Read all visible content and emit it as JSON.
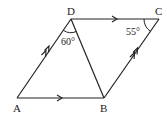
{
  "figure": {
    "type": "parallelogram",
    "vertices": {
      "A": {
        "label": "A",
        "x": 17,
        "y": 98
      },
      "B": {
        "label": "B",
        "x": 104,
        "y": 98
      },
      "C": {
        "label": "C",
        "x": 159,
        "y": 19
      },
      "D": {
        "label": "D",
        "x": 71,
        "y": 19
      }
    },
    "segments": [
      "AB",
      "BC",
      "CD",
      "DA",
      "DB"
    ],
    "parallel_marks": {
      "AB": "single arrow",
      "DC": "single arrow",
      "AD": "double arrow",
      "BC": "double arrow"
    },
    "angles": {
      "ADB": {
        "label": "60°"
      },
      "DCB": {
        "label": "55°"
      }
    },
    "stroke_color": "#222222"
  }
}
